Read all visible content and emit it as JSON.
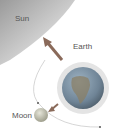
{
  "diagram": {
    "labels": {
      "sun": "Sun",
      "earth": "Earth",
      "moon": "Moon"
    },
    "colors": {
      "sun_dark": "#8a8a8a",
      "sun_light": "#e8e8e8",
      "earth_ocean": "#6f8fa8",
      "earth_land": "#8a7a5a",
      "earth_halo": "#e4e4e4",
      "moon": "#b8b8a8",
      "arrow": "#8a6a5a",
      "orbit": "#cccccc"
    }
  }
}
